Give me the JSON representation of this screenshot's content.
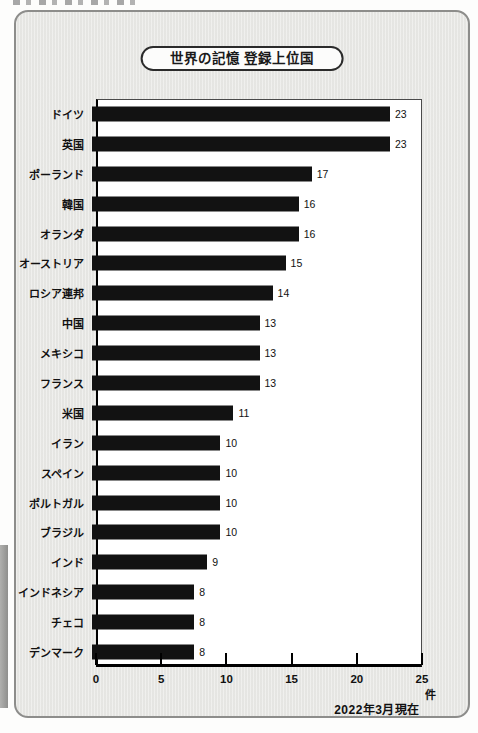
{
  "panel": {
    "title": "世界の記憶 登録上位国",
    "source_note": "2022年3月現在"
  },
  "chart_data": {
    "type": "bar",
    "orientation": "horizontal",
    "title": "世界の記憶 登録上位国",
    "categories": [
      "ドイツ",
      "英国",
      "ポーランド",
      "韓国",
      "オランダ",
      "オーストリア",
      "ロシア連邦",
      "中国",
      "メキシコ",
      "フランス",
      "米国",
      "イラン",
      "スペイン",
      "ポルトガル",
      "ブラジル",
      "インド",
      "インドネシア",
      "チェコ",
      "デンマーク"
    ],
    "values": [
      23,
      23,
      17,
      16,
      16,
      15,
      14,
      13,
      13,
      13,
      11,
      10,
      10,
      10,
      10,
      9,
      8,
      8,
      8
    ],
    "xlabel": "件",
    "xlim": [
      0,
      25
    ],
    "xticks": [
      0,
      5,
      10,
      15,
      20,
      25
    ],
    "grid": false,
    "legend": false,
    "bar_color": "#121212",
    "annotation": "2022年3月現在"
  }
}
